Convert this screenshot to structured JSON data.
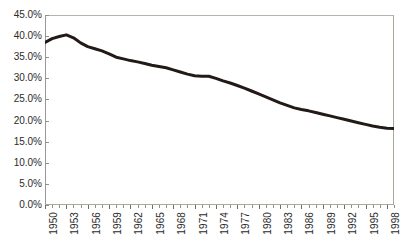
{
  "title_fragment": "",
  "colors": {
    "line": "#231a18",
    "frame": "#a9a9a0",
    "tick": "#8f8f87",
    "text": "#2b2b2b",
    "background": "#ffffff"
  },
  "axes": {
    "y_tick_labels": [
      "45.0%",
      "40.0%",
      "35.0%",
      "30.0%",
      "25.0%",
      "20.0%",
      "15.0%",
      "10.0%",
      "5.0%",
      "0.0%"
    ],
    "x_tick_labels": [
      "1950",
      "1953",
      "1956",
      "1959",
      "1962",
      "1965",
      "1968",
      "1971",
      "1974",
      "1977",
      "1980",
      "1983",
      "1986",
      "1989",
      "1992",
      "1995",
      "1998"
    ]
  },
  "chart_data": {
    "type": "line",
    "title": "",
    "xlabel": "",
    "ylabel": "",
    "xlim": [
      1950,
      1999
    ],
    "ylim": [
      0,
      45
    ],
    "ytick_interval": 5,
    "ytick_format": "percent_one_decimal",
    "xtick_interval_minor": 1,
    "xtick_interval_labeled": 3,
    "grid": false,
    "legend": false,
    "line_width": 3,
    "series": [
      {
        "name": "",
        "color": "#231a18",
        "x": [
          1950,
          1951,
          1952,
          1953,
          1954,
          1955,
          1956,
          1957,
          1958,
          1959,
          1960,
          1961,
          1962,
          1963,
          1964,
          1965,
          1966,
          1967,
          1968,
          1969,
          1970,
          1971,
          1972,
          1973,
          1974,
          1975,
          1976,
          1977,
          1978,
          1979,
          1980,
          1981,
          1982,
          1983,
          1984,
          1985,
          1986,
          1987,
          1988,
          1989,
          1990,
          1991,
          1992,
          1993,
          1994,
          1995,
          1996,
          1997,
          1998,
          1999
        ],
        "values": [
          38.5,
          39.4,
          39.9,
          40.3,
          39.6,
          38.4,
          37.5,
          37.0,
          36.5,
          35.8,
          35.0,
          34.6,
          34.2,
          33.9,
          33.5,
          33.1,
          32.8,
          32.5,
          32.0,
          31.5,
          31.0,
          30.6,
          30.5,
          30.5,
          30.0,
          29.4,
          28.9,
          28.3,
          27.7,
          27.0,
          26.3,
          25.6,
          24.9,
          24.2,
          23.6,
          23.0,
          22.6,
          22.3,
          21.9,
          21.5,
          21.1,
          20.7,
          20.3,
          19.9,
          19.5,
          19.1,
          18.7,
          18.4,
          18.2,
          18.1
        ]
      }
    ]
  }
}
